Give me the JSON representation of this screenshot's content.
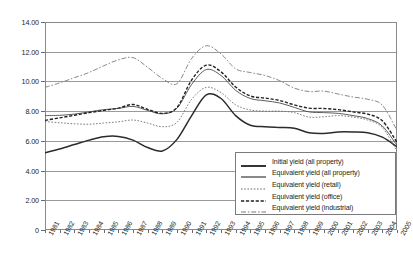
{
  "chart_data": {
    "type": "line",
    "title": "",
    "xlabel": "",
    "ylabel": "",
    "ylim": [
      0,
      14
    ],
    "ytick_step": 2,
    "grid": true,
    "legend_position": "inside-bottom-right",
    "x": [
      "1981",
      "1982",
      "1983",
      "1984",
      "1985",
      "1986",
      "1987",
      "1988",
      "1989",
      "1990",
      "1991",
      "1992",
      "1993",
      "1994",
      "1995",
      "1996",
      "1997",
      "1998",
      "1999",
      "2000",
      "2001",
      "2002",
      "2003",
      "2004",
      "2005"
    ],
    "ytick_labels": [
      "0",
      "2.00",
      "4.00",
      "6.00",
      "8.00",
      "10.00",
      "12.00",
      "14.00"
    ],
    "ytick_values": [
      0,
      2,
      4,
      6,
      8,
      10,
      12,
      14
    ],
    "series": [
      {
        "name": "Initial yield (all property)",
        "style": "solid-thick",
        "color": "#2b2b2b",
        "values": [
          5.2,
          5.45,
          5.75,
          6.05,
          6.28,
          6.3,
          6.05,
          5.55,
          5.32,
          6.1,
          7.7,
          9.1,
          8.85,
          7.7,
          7.05,
          6.95,
          6.9,
          6.85,
          6.55,
          6.5,
          6.6,
          6.6,
          6.55,
          6.25,
          5.6
        ]
      },
      {
        "name": "Equivalent yield (all property)",
        "style": "solid-thin",
        "color": "#4a4a4a",
        "values": [
          7.7,
          7.72,
          7.8,
          7.95,
          8.1,
          8.18,
          8.32,
          8.05,
          7.82,
          8.2,
          9.8,
          10.8,
          10.4,
          9.4,
          8.85,
          8.7,
          8.55,
          8.25,
          7.95,
          7.9,
          7.85,
          7.7,
          7.5,
          7.0,
          5.7
        ]
      },
      {
        "name": "Equivalent yield (retail)",
        "style": "dotted",
        "color": "#6d6d6d",
        "values": [
          7.3,
          7.22,
          7.15,
          7.12,
          7.2,
          7.28,
          7.4,
          7.2,
          6.95,
          7.25,
          8.8,
          9.6,
          9.25,
          8.42,
          8.08,
          8.0,
          8.0,
          7.9,
          7.6,
          7.62,
          7.7,
          7.6,
          7.4,
          6.9,
          5.3
        ]
      },
      {
        "name": "Equivalent yield (office)",
        "style": "dashed",
        "color": "#222222",
        "values": [
          7.38,
          7.55,
          7.72,
          7.9,
          8.05,
          8.2,
          8.45,
          8.12,
          7.85,
          8.25,
          10.1,
          11.1,
          10.65,
          9.62,
          9.02,
          8.88,
          8.72,
          8.42,
          8.2,
          8.18,
          8.1,
          7.95,
          7.8,
          7.35,
          5.9
        ]
      },
      {
        "name": "Equivalent yield (industrial)",
        "style": "dash-dot",
        "color": "#7a7a7a",
        "values": [
          9.6,
          9.9,
          10.25,
          10.6,
          11.05,
          11.45,
          11.6,
          10.95,
          10.2,
          9.85,
          11.55,
          12.4,
          11.85,
          10.85,
          10.6,
          10.4,
          10.05,
          9.55,
          9.32,
          9.35,
          9.15,
          8.95,
          8.8,
          8.4,
          6.7
        ]
      }
    ]
  },
  "legend": {
    "items": [
      {
        "label": "Initial yield (all property)"
      },
      {
        "label": "Equivalent yield (all property)"
      },
      {
        "label": "Equivalent yield (retail)"
      },
      {
        "label": "Equivalent yield (office)"
      },
      {
        "label": "Equivalent yield (industrial)"
      }
    ]
  }
}
